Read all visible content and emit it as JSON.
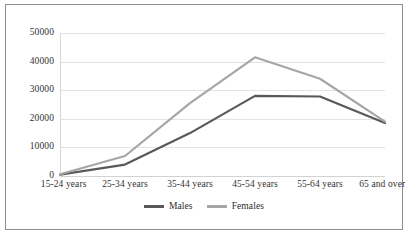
{
  "chart_data": {
    "type": "line",
    "title": "",
    "subtitle": "",
    "xlabel": "",
    "ylabel": "",
    "categories": [
      "15-24 years",
      "25-34 years",
      "35-44 years",
      "45-54 years",
      "55-64 years",
      "65 and over"
    ],
    "series": [
      {
        "name": "Males",
        "color": "#595959",
        "values": [
          500,
          4000,
          15000,
          28000,
          27800,
          18500
        ]
      },
      {
        "name": "Females",
        "color": "#a6a6a6",
        "values": [
          600,
          7000,
          25500,
          41500,
          34000,
          19000
        ]
      }
    ],
    "ylim": [
      0,
      50000
    ],
    "ytick_values": [
      0,
      10000,
      20000,
      30000,
      40000,
      50000
    ],
    "ytick_labels": [
      "0",
      "10000",
      "20000",
      "30000",
      "40000",
      "50000"
    ],
    "grid": true,
    "grid_axis": "y",
    "legend_position": "bottom-center",
    "markers": false,
    "line_width": 2.2
  },
  "legend": {
    "items": [
      {
        "label": "Males",
        "color": "#595959"
      },
      {
        "label": "Females",
        "color": "#a6a6a6"
      }
    ]
  },
  "colors": {
    "males": "#595959",
    "females": "#a6a6a6",
    "gridline": "#e3e3e3",
    "frame": "#8f8f8f",
    "text": "#333333",
    "background": "#ffffff"
  }
}
